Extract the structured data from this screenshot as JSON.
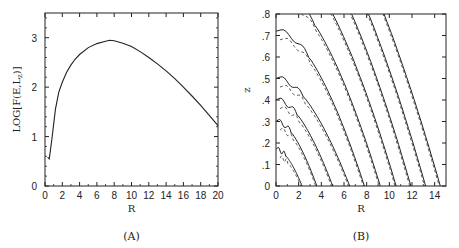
{
  "figure": {
    "panels": [
      {
        "id": "A",
        "label": "(A)"
      },
      {
        "id": "B",
        "label": "(B)"
      }
    ]
  },
  "chart_data": [
    {
      "type": "line",
      "panel": "(A)",
      "title": "",
      "xlabel": "R",
      "ylabel": "LOG[F(E,L_z)]",
      "xlim": [
        0,
        20
      ],
      "ylim": [
        0,
        3.5
      ],
      "xticks": [
        0,
        2,
        4,
        6,
        8,
        10,
        12,
        14,
        16,
        18,
        20
      ],
      "yticks": [
        0,
        1,
        2,
        3
      ],
      "grid": false,
      "series": [
        {
          "name": "LOG[F(E,L_z)]",
          "x": [
            0.3,
            0.5,
            0.8,
            1.2,
            1.6,
            2.0,
            2.5,
            3.0,
            3.5,
            4.0,
            5.0,
            6.0,
            7.0,
            7.5,
            8.0,
            9.0,
            10.0,
            11.0,
            12.0,
            13.0,
            14.0,
            15.0,
            16.0,
            17.0,
            18.0,
            19.0,
            20.0
          ],
          "y": [
            0.58,
            0.55,
            0.95,
            1.55,
            1.9,
            2.1,
            2.3,
            2.45,
            2.57,
            2.66,
            2.8,
            2.88,
            2.93,
            2.95,
            2.94,
            2.89,
            2.82,
            2.72,
            2.6,
            2.47,
            2.33,
            2.17,
            2.0,
            1.82,
            1.63,
            1.43,
            1.22
          ]
        }
      ]
    },
    {
      "type": "line",
      "panel": "(B)",
      "title": "",
      "xlabel": "R",
      "ylabel": "z",
      "xlim": [
        0,
        15
      ],
      "ylim": [
        0,
        0.8
      ],
      "xticks": [
        0,
        2,
        4,
        6,
        8,
        10,
        12,
        14
      ],
      "yticks": [
        0,
        0.1,
        0.2,
        0.3,
        0.4,
        0.5,
        0.6,
        0.7,
        0.8
      ],
      "ytick_labels": [
        "0",
        ".1",
        ".2",
        ".3",
        ".4",
        ".5",
        ".6",
        ".7",
        ".8"
      ],
      "grid": false,
      "description": "Contour map in (R, z): solid curves with paired dashed curves, descending diagonally from upper-left to lower-right",
      "series": [
        {
          "name": "contour-1 (solid)",
          "R_at_z0": 2.3,
          "z_at_R0": 0.17
        },
        {
          "name": "contour-2 (solid)",
          "R_at_z0": 3.6,
          "z_at_R0": 0.3
        },
        {
          "name": "contour-3 (solid)",
          "R_at_z0": 5.0,
          "z_at_R0": 0.4
        },
        {
          "name": "contour-4 (solid)",
          "R_at_z0": 6.5,
          "z_at_R0": 0.5
        },
        {
          "name": "contour-5 (solid)",
          "R_at_z0": 7.8,
          "z_at_R0": 0.6
        },
        {
          "name": "contour-6 (solid)",
          "R_at_z0": 9.2,
          "z_at_R0": 0.66
        },
        {
          "name": "contour-7 (solid)",
          "R_at_z0": 10.6,
          "z_at_R0": 0.72
        },
        {
          "name": "contour-8 (solid)",
          "R_at_z0": 11.9,
          "z_at_R0": 0.76
        },
        {
          "name": "contour-9 (solid)",
          "R_at_z0": 13.2,
          "z_at_R0": 0.79
        },
        {
          "name": "contour-10 (solid)",
          "R_at_z0": 14.5,
          "z_at_R0": 0.8
        }
      ]
    }
  ]
}
